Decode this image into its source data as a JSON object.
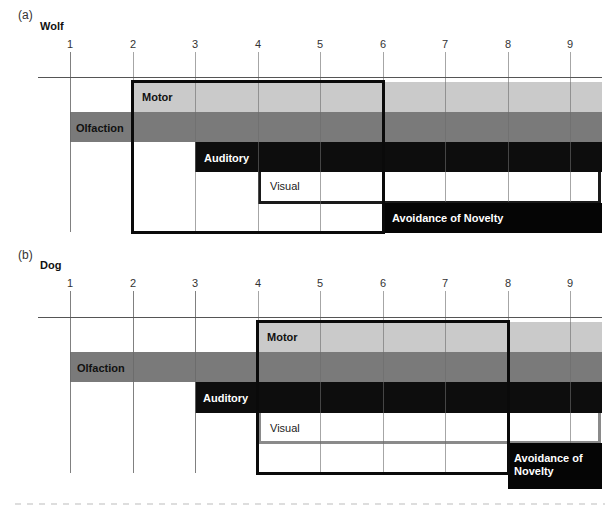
{
  "panels": [
    {
      "letter": "(a)",
      "title": "Wolf",
      "ticks": [
        "1",
        "2",
        "3",
        "4",
        "5",
        "6",
        "7",
        "8",
        "9"
      ],
      "bars": {
        "motor": {
          "label": "Motor",
          "start": 2,
          "end": "beyond 9"
        },
        "olfaction": {
          "label": "Olfaction",
          "start": 1,
          "end": "beyond 9"
        },
        "auditory": {
          "label": "Auditory",
          "start": 3,
          "end": "beyond 9"
        },
        "visual": {
          "label": "Visual",
          "start": 4,
          "end": "beyond 9"
        },
        "avoidance": {
          "label": "Avoidance of Novelty",
          "start": 6,
          "end": "beyond 9"
        }
      },
      "socialization_window": {
        "start": 2,
        "end": 6
      }
    },
    {
      "letter": "(b)",
      "title": "Dog",
      "ticks": [
        "1",
        "2",
        "3",
        "4",
        "5",
        "6",
        "7",
        "8",
        "9"
      ],
      "bars": {
        "motor": {
          "label": "Motor",
          "start": 4,
          "end": "beyond 9"
        },
        "olfaction": {
          "label": "Olfaction",
          "start": 1,
          "end": "beyond 9"
        },
        "auditory": {
          "label": "Auditory",
          "start": 3,
          "end": "beyond 9"
        },
        "visual": {
          "label": "Visual",
          "start": 4,
          "end": "beyond 9"
        },
        "avoidance": {
          "label": "Avoidance of Novelty",
          "label_line1": "Avoidance of",
          "label_line2": "Novelty",
          "start": 8,
          "end": "beyond 9"
        }
      },
      "socialization_window": {
        "start": 4,
        "end": 8
      }
    }
  ],
  "colors": {
    "motor": "#cacaca",
    "olfaction": "#7a7a7a",
    "auditory": "#0d0d0d",
    "avoidance": "#050505",
    "outline": "#0a0a0a"
  }
}
